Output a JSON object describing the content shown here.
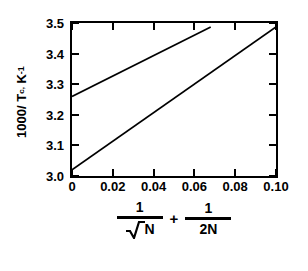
{
  "chart_data": {
    "type": "line",
    "title": "",
    "xlabel": "1/sqrt(N) + 1/(2N)",
    "ylabel": "1000/ Tc, K^-1",
    "xlim": [
      0,
      0.1
    ],
    "ylim": [
      3.0,
      3.5
    ],
    "grid": false,
    "legend": "none",
    "xticks": [
      "0",
      "0.02",
      "0.04",
      "0.06",
      "0.08",
      "0.10"
    ],
    "xtickvalues": [
      0,
      0.02,
      0.04,
      0.06,
      0.08,
      0.1
    ],
    "yticks": [
      "3.0",
      "3.1",
      "3.2",
      "3.3",
      "3.4",
      "3.5"
    ],
    "ytickvalues": [
      3.0,
      3.1,
      3.2,
      3.3,
      3.4,
      3.5
    ],
    "series": [
      {
        "name": "upper-line",
        "x": [
          0.0,
          0.068
        ],
        "y": [
          3.26,
          3.487
        ],
        "color": "#000000"
      },
      {
        "name": "lower-line",
        "x": [
          0.0,
          0.1
        ],
        "y": [
          3.02,
          3.487
        ],
        "color": "#000000"
      }
    ]
  },
  "axes": {
    "y_title": {
      "prefix": "1000/ T",
      "subscript": "c,",
      "unit": "K",
      "superscript": "-1"
    },
    "x_title": {
      "term1_numerator": "1",
      "term1_denominator": "N",
      "operator": "+",
      "term2_numerator": "1",
      "term2_denominator": "2N"
    }
  },
  "colors": {
    "line": "#000000",
    "axis": "#000000",
    "background": "#ffffff"
  }
}
